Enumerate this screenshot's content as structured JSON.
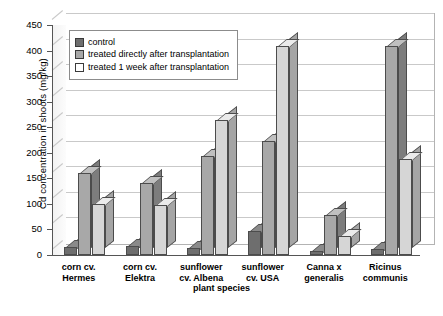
{
  "chart_data": {
    "type": "bar",
    "title": "",
    "xlabel": "plant species",
    "ylabel": "Cd concentration in shoots (mg/kg)",
    "ylim": [
      0,
      450
    ],
    "yticks": [
      0,
      50,
      100,
      150,
      200,
      250,
      300,
      350,
      400,
      450
    ],
    "grid": true,
    "legend_position": "upper-left-inside",
    "categories": [
      "corn cv. Hermes",
      "corn cv. Elektra",
      "sunflower cv. Albena",
      "sunflower cv. USA",
      "Canna x generalis",
      "Ricinus communis"
    ],
    "category_lines": [
      [
        "corn cv.",
        "Hermes"
      ],
      [
        "corn cv.",
        "Elektra"
      ],
      [
        "sunflower",
        "cv. Albena"
      ],
      [
        "sunflower",
        "cv. USA"
      ],
      [
        "Canna x",
        "generalis"
      ],
      [
        "Ricinus",
        "communis"
      ]
    ],
    "series": [
      {
        "name": "control",
        "color": "#6e6e6e",
        "values": [
          15,
          18,
          13,
          46,
          8,
          12
        ]
      },
      {
        "name": "treated directly after transplantation",
        "color": "#a8a8a8",
        "values": [
          160,
          140,
          193,
          223,
          78,
          408
        ]
      },
      {
        "name": "treated 1 week after transplantation",
        "color": "#ffffff",
        "values": [
          100,
          97,
          265,
          409,
          38,
          188
        ]
      }
    ]
  },
  "legend": {
    "items": [
      "control",
      "treated directly after transplantation",
      "treated 1 week after transplantation"
    ]
  },
  "axes": {
    "y_title": "Cd concentration in shoots (mg/kg)",
    "x_title": "plant species",
    "y_ticks": [
      "450",
      "400",
      "350",
      "300",
      "250",
      "200",
      "150",
      "100",
      "50",
      "0"
    ]
  }
}
